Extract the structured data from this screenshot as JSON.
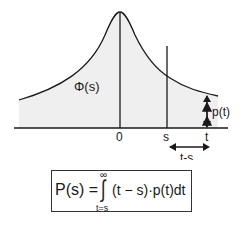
{
  "diagram": {
    "curve_label": "Φ(s)",
    "axis_labels": {
      "zero": "0",
      "s": "s",
      "t": "t"
    },
    "height_label": "p(t)",
    "interval_label": "t-s",
    "colors": {
      "line": "#1a1a1a",
      "fill": "#eeeeee",
      "background": "#ffffff"
    }
  },
  "formula": {
    "lhs": "P(s) =",
    "integral": "∫",
    "upper_limit": "∞",
    "lower_limit": "t=s",
    "integrand": "(t − s)·p(t)dt"
  }
}
